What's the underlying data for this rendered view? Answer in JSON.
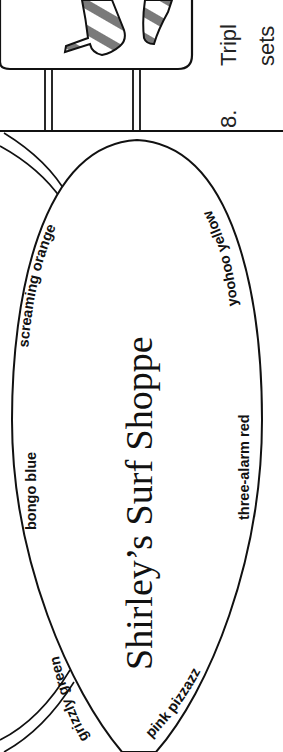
{
  "page": {
    "orientation": "rotated-90-clockwise",
    "background": "#ffffff",
    "ink": "#111111",
    "stripe_gray": "#7a7a7a"
  },
  "question": {
    "number": "8.",
    "line1": "Tripl",
    "line2": "sets"
  },
  "surfboard": {
    "title": "Shirley’s Surf Shoppe",
    "color_labels": {
      "bongo_blue": "bongo blue",
      "screaming_orange": "screaming orange",
      "yoohoo_yellow": "yoohoo yellow",
      "three_alarm_red": "three-alarm red",
      "grizzly_green": "grizzly green",
      "pink_pizzazz": "pink pizzazz"
    }
  }
}
